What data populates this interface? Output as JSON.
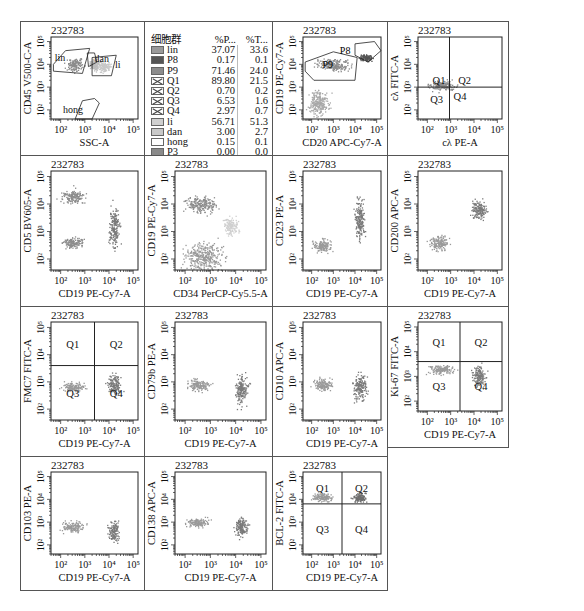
{
  "figure": {
    "sample_id": "232783",
    "tick_labels": [
      "10²",
      "10³",
      "10⁴",
      "10⁵"
    ]
  },
  "legend": {
    "header": {
      "population": "细胞群",
      "col_parent": "%P...",
      "col_total": "%T..."
    },
    "rows": [
      {
        "name": "lin",
        "parent": "37.07",
        "total": "33.6",
        "swatch": "#9a9a9a",
        "style": "solid"
      },
      {
        "name": "P8",
        "parent": "0.17",
        "total": "0.1",
        "swatch": "#555555",
        "style": "solid"
      },
      {
        "name": "P9",
        "parent": "71.46",
        "total": "24.0",
        "swatch": "#8c8c8c",
        "style": "solid"
      },
      {
        "name": "Q1",
        "parent": "89.80",
        "total": "21.5",
        "swatch": "#ffffff",
        "style": "cross"
      },
      {
        "name": "Q2",
        "parent": "0.70",
        "total": "0.2",
        "swatch": "#ffffff",
        "style": "cross"
      },
      {
        "name": "Q3",
        "parent": "6.53",
        "total": "1.6",
        "swatch": "#ffffff",
        "style": "cross"
      },
      {
        "name": "Q4",
        "parent": "2.97",
        "total": "0.7",
        "swatch": "#ffffff",
        "style": "cross"
      },
      {
        "name": "li",
        "parent": "56.71",
        "total": "51.3",
        "swatch": "#cfcfcf",
        "style": "solid"
      },
      {
        "name": "dan",
        "parent": "3.00",
        "total": "2.7",
        "swatch": "#c8c8c8",
        "style": "solid"
      },
      {
        "name": "hong",
        "parent": "0.15",
        "total": "0.1",
        "swatch": "#ffffff",
        "style": "solid"
      },
      {
        "name": "P3",
        "parent": "0.00",
        "total": "0.0",
        "swatch": "#8a8a8a",
        "style": "solid"
      },
      {
        "name": "lin AND P9",
        "parent": "26.49",
        "total": "24.0",
        "swatch": "#8f8f8f",
        "style": "solid"
      }
    ]
  },
  "chart_data": [
    {
      "id": "p1",
      "type": "scatter",
      "title": "232783",
      "xlabel": "SSC-A",
      "ylabel": "CD45 V500-C-A",
      "xticks": [
        "10²",
        "10³",
        "10⁴",
        "10⁵"
      ],
      "yticks": [
        "10²",
        "10³",
        "10⁴",
        "10⁵"
      ],
      "gates": [
        "lin",
        "dan",
        "li",
        "hong"
      ],
      "clusters": [
        {
          "x": 2.6,
          "y": 4.0,
          "rx": 0.45,
          "ry": 0.35,
          "shade": "#8c8c8c"
        },
        {
          "x": 3.4,
          "y": 4.0,
          "rx": 0.3,
          "ry": 0.3,
          "shade": "#bdbdbd"
        },
        {
          "x": 3.8,
          "y": 3.9,
          "rx": 0.35,
          "ry": 0.3,
          "shade": "#c8c8c8"
        }
      ]
    },
    {
      "id": "p3",
      "type": "scatter",
      "title": "232783",
      "xlabel": "CD20 APC-Cy7-A",
      "ylabel": "CD19 PE-Cy7-A",
      "xticks": [
        "10²",
        "10³",
        "10⁴",
        "10⁵"
      ],
      "yticks": [
        "10²",
        "10³",
        "10⁴",
        "10⁵"
      ],
      "gates": [
        "P8",
        "P9"
      ],
      "clusters": [
        {
          "x": 3.0,
          "y": 4.0,
          "rx": 1.0,
          "ry": 0.35,
          "shade": "#8c8c8c"
        },
        {
          "x": 4.5,
          "y": 4.3,
          "rx": 0.4,
          "ry": 0.2,
          "shade": "#555555"
        },
        {
          "x": 2.3,
          "y": 2.3,
          "rx": 0.6,
          "ry": 0.7,
          "shade": "#a8a8a8"
        }
      ]
    },
    {
      "id": "p4",
      "type": "scatter",
      "title": "232783",
      "xlabel": "cλ PE-A",
      "ylabel": "cλ FITC-A",
      "xticks": [
        "10²",
        "10³",
        "10⁴",
        "10⁵"
      ],
      "yticks": [
        "10²",
        "10³",
        "10⁴",
        "10⁵"
      ],
      "quadrants": [
        "Q1",
        "Q2",
        "Q3",
        "Q4"
      ],
      "clusters": [
        {
          "x": 2.6,
          "y": 3.1,
          "rx": 0.8,
          "ry": 0.3,
          "shade": "#8c8c8c"
        }
      ]
    },
    {
      "id": "p5",
      "type": "scatter",
      "title": "232783",
      "xlabel": "CD19 PE-Cy7-A",
      "ylabel": "CD5 BV605-A",
      "xticks": [
        "10²",
        "10³",
        "10⁴",
        "10⁵"
      ],
      "yticks": [
        "10²",
        "10³",
        "10⁴",
        "10⁵"
      ],
      "clusters": [
        {
          "x": 2.5,
          "y": 4.3,
          "rx": 0.6,
          "ry": 0.35,
          "shade": "#8c8c8c"
        },
        {
          "x": 2.5,
          "y": 2.6,
          "rx": 0.6,
          "ry": 0.25,
          "shade": "#8c8c8c"
        },
        {
          "x": 4.2,
          "y": 3.2,
          "rx": 0.3,
          "ry": 1.0,
          "shade": "#7a7a7a"
        }
      ]
    },
    {
      "id": "p6",
      "type": "scatter",
      "title": "232783",
      "xlabel": "CD34 PerCP-Cy5.5-A",
      "ylabel": "CD19 PE-Cy7-A",
      "xticks": [
        "10²",
        "10³",
        "10⁴",
        "10⁵"
      ],
      "yticks": [
        "10²",
        "10³",
        "10⁴",
        "10⁵"
      ],
      "clusters": [
        {
          "x": 2.6,
          "y": 4.0,
          "rx": 0.8,
          "ry": 0.4,
          "shade": "#8c8c8c"
        },
        {
          "x": 2.7,
          "y": 2.1,
          "rx": 1.0,
          "ry": 0.7,
          "shade": "#9a9a9a"
        },
        {
          "x": 3.8,
          "y": 3.2,
          "rx": 0.4,
          "ry": 0.4,
          "shade": "#d0d0d0"
        }
      ]
    },
    {
      "id": "p7",
      "type": "scatter",
      "title": "232783",
      "xlabel": "CD19 PE-Cy7-A",
      "ylabel": "CD23 PE-A",
      "xticks": [
        "10²",
        "10³",
        "10⁴",
        "10⁵"
      ],
      "yticks": [
        "10²",
        "10³",
        "10⁴",
        "10⁵"
      ],
      "clusters": [
        {
          "x": 2.5,
          "y": 2.5,
          "rx": 0.6,
          "ry": 0.3,
          "shade": "#9a9a9a"
        },
        {
          "x": 4.2,
          "y": 3.4,
          "rx": 0.3,
          "ry": 1.0,
          "shade": "#7a7a7a"
        }
      ]
    },
    {
      "id": "p8",
      "type": "scatter",
      "title": "232783",
      "xlabel": "CD19 PE-Cy7-A",
      "ylabel": "CD200 APC-A",
      "xticks": [
        "10²",
        "10³",
        "10⁴",
        "10⁵"
      ],
      "yticks": [
        "10²",
        "10³",
        "10⁴",
        "10⁵"
      ],
      "clusters": [
        {
          "x": 2.5,
          "y": 2.6,
          "rx": 0.55,
          "ry": 0.35,
          "shade": "#9a9a9a"
        },
        {
          "x": 4.2,
          "y": 3.8,
          "rx": 0.45,
          "ry": 0.45,
          "shade": "#7a7a7a"
        }
      ]
    },
    {
      "id": "p9",
      "type": "scatter",
      "title": "232783",
      "xlabel": "CD19 PE-Cy7-A",
      "ylabel": "FMC7 FITC-A",
      "xticks": [
        "10²",
        "10³",
        "10⁴",
        "10⁵"
      ],
      "yticks": [
        "10²",
        "10³",
        "10⁴",
        "10⁵"
      ],
      "quadrants": [
        "Q1",
        "Q2",
        "Q3",
        "Q4"
      ],
      "clusters": [
        {
          "x": 2.5,
          "y": 2.8,
          "rx": 0.6,
          "ry": 0.25,
          "shade": "#9a9a9a"
        },
        {
          "x": 4.2,
          "y": 2.9,
          "rx": 0.35,
          "ry": 0.5,
          "shade": "#7a7a7a"
        }
      ]
    },
    {
      "id": "p10",
      "type": "scatter",
      "title": "232783",
      "xlabel": "CD19 PE-Cy7-A",
      "ylabel": "CD79b PE-A",
      "xticks": [
        "10²",
        "10³",
        "10⁴",
        "10⁵"
      ],
      "yticks": [
        "10²",
        "10³",
        "10⁴",
        "10⁵"
      ],
      "clusters": [
        {
          "x": 2.5,
          "y": 2.9,
          "rx": 0.6,
          "ry": 0.3,
          "shade": "#9a9a9a"
        },
        {
          "x": 4.2,
          "y": 2.7,
          "rx": 0.35,
          "ry": 0.7,
          "shade": "#7a7a7a"
        }
      ]
    },
    {
      "id": "p11",
      "type": "scatter",
      "title": "232783",
      "xlabel": "CD19 PE-Cy7-A",
      "ylabel": "CD10 APC-A",
      "xticks": [
        "10²",
        "10³",
        "10⁴",
        "10⁵"
      ],
      "yticks": [
        "10²",
        "10³",
        "10⁴",
        "10⁵"
      ],
      "clusters": [
        {
          "x": 2.5,
          "y": 2.9,
          "rx": 0.55,
          "ry": 0.3,
          "shade": "#9a9a9a"
        },
        {
          "x": 4.2,
          "y": 2.8,
          "rx": 0.4,
          "ry": 0.65,
          "shade": "#7a7a7a"
        }
      ]
    },
    {
      "id": "p12",
      "type": "scatter",
      "title": "232783",
      "xlabel": "CD19 PE-Cy7-A",
      "ylabel": "Ki-67 FITC-A",
      "xticks": [
        "10²",
        "10³",
        "10⁴",
        "10⁵"
      ],
      "yticks": [
        "10²",
        "10³",
        "10⁴",
        "10⁵"
      ],
      "quadrants": [
        "Q1",
        "Q2",
        "Q3",
        "Q4"
      ],
      "clusters": [
        {
          "x": 2.6,
          "y": 3.3,
          "rx": 0.7,
          "ry": 0.25,
          "shade": "#9a9a9a"
        },
        {
          "x": 4.2,
          "y": 3.0,
          "rx": 0.35,
          "ry": 0.6,
          "shade": "#7a7a7a"
        }
      ]
    },
    {
      "id": "p13",
      "type": "scatter",
      "title": "232783",
      "xlabel": "CD19 PE-Cy7-A",
      "ylabel": "CD103 PE-A",
      "xticks": [
        "10²",
        "10³",
        "10⁴",
        "10⁵"
      ],
      "yticks": [
        "10²",
        "10³",
        "10⁴",
        "10⁵"
      ],
      "clusters": [
        {
          "x": 2.5,
          "y": 2.8,
          "rx": 0.6,
          "ry": 0.3,
          "shade": "#9a9a9a"
        },
        {
          "x": 4.2,
          "y": 2.6,
          "rx": 0.3,
          "ry": 0.55,
          "shade": "#7a7a7a"
        }
      ]
    },
    {
      "id": "p14",
      "type": "scatter",
      "title": "232783",
      "xlabel": "CD19 PE-Cy7-A",
      "ylabel": "CD138 APC-A",
      "xticks": [
        "10²",
        "10³",
        "10⁴",
        "10⁵"
      ],
      "yticks": [
        "10²",
        "10³",
        "10⁴",
        "10⁵"
      ],
      "clusters": [
        {
          "x": 2.5,
          "y": 3.0,
          "rx": 0.6,
          "ry": 0.25,
          "shade": "#9a9a9a"
        },
        {
          "x": 4.2,
          "y": 2.8,
          "rx": 0.35,
          "ry": 0.55,
          "shade": "#7a7a7a"
        }
      ]
    },
    {
      "id": "p15",
      "type": "scatter",
      "title": "232783",
      "xlabel": "CD19 PE-Cy7-A",
      "ylabel": "BCL-2 FITC-A",
      "xticks": [
        "10²",
        "10³",
        "10⁴",
        "10⁵"
      ],
      "yticks": [
        "10²",
        "10³",
        "10⁴",
        "10⁵"
      ],
      "quadrants": [
        "Q1",
        "Q2",
        "Q3",
        "Q4"
      ],
      "clusters": [
        {
          "x": 2.5,
          "y": 4.1,
          "rx": 0.6,
          "ry": 0.25,
          "shade": "#9a9a9a"
        },
        {
          "x": 4.2,
          "y": 4.1,
          "rx": 0.4,
          "ry": 0.3,
          "shade": "#6f6f6f"
        }
      ]
    }
  ]
}
